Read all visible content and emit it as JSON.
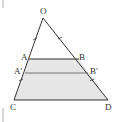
{
  "diagram": {
    "type": "geometry-triangle-with-parallels",
    "points": {
      "O": {
        "label": "O",
        "x": 43,
        "y": 18
      },
      "A": {
        "label": "A",
        "x": 29,
        "y": 59
      },
      "B": {
        "label": "B",
        "x": 79,
        "y": 59
      },
      "A_prime": {
        "label": "A'",
        "x": 25,
        "y": 73
      },
      "B_prime": {
        "label": "B'",
        "x": 88,
        "y": 73
      },
      "C": {
        "label": "C",
        "x": 14,
        "y": 100
      },
      "D": {
        "label": "D",
        "x": 108,
        "y": 100
      }
    },
    "segments": [
      "OC",
      "OD",
      "AB",
      "A'B'",
      "CD"
    ],
    "shaded_region": "ABDC",
    "colors": {
      "line": "#333333",
      "shade": "#e6e6e6",
      "label": "#333333"
    }
  }
}
